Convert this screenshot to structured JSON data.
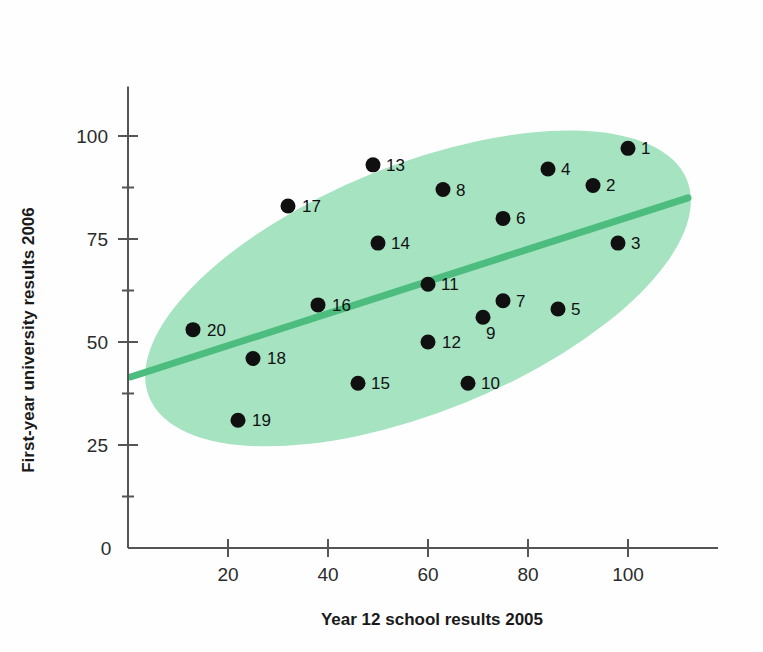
{
  "chart_data": {
    "type": "scatter",
    "title": "",
    "xlabel": "Year 12 school results 2005",
    "ylabel": "First-year university results 2006",
    "xlim": [
      0,
      118
    ],
    "ylim": [
      0,
      112
    ],
    "xticks": [
      0,
      20,
      40,
      60,
      80,
      100
    ],
    "xtick_labels": [
      "0",
      "20",
      "40",
      "60",
      "80",
      "100"
    ],
    "yticks": [
      0,
      25,
      50,
      75,
      100
    ],
    "ytick_labels": [
      "0",
      "25",
      "50",
      "75",
      "100"
    ],
    "grid": false,
    "legend": "none",
    "points": [
      {
        "label": "1",
        "x": 100,
        "y": 97
      },
      {
        "label": "2",
        "x": 93,
        "y": 88
      },
      {
        "label": "3",
        "x": 98,
        "y": 74
      },
      {
        "label": "4",
        "x": 84,
        "y": 92
      },
      {
        "label": "5",
        "x": 86,
        "y": 58
      },
      {
        "label": "6",
        "x": 75,
        "y": 80
      },
      {
        "label": "7",
        "x": 75,
        "y": 60
      },
      {
        "label": "8",
        "x": 63,
        "y": 87
      },
      {
        "label": "9",
        "x": 71,
        "y": 56
      },
      {
        "label": "10",
        "x": 68,
        "y": 40
      },
      {
        "label": "11",
        "x": 60,
        "y": 64
      },
      {
        "label": "12",
        "x": 60,
        "y": 50
      },
      {
        "label": "13",
        "x": 49,
        "y": 93
      },
      {
        "label": "14",
        "x": 50,
        "y": 74
      },
      {
        "label": "15",
        "x": 46,
        "y": 40
      },
      {
        "label": "16",
        "x": 38,
        "y": 59
      },
      {
        "label": "17",
        "x": 32,
        "y": 83
      },
      {
        "label": "18",
        "x": 25,
        "y": 46
      },
      {
        "label": "19",
        "x": 22,
        "y": 31
      },
      {
        "label": "20",
        "x": 13,
        "y": 53
      }
    ],
    "trend_line": {
      "x_start": 0.5,
      "y_start": 41.5,
      "x_end": 112,
      "y_end": 85
    },
    "ellipse_overlay": {
      "center_x": 58,
      "center_y": 63,
      "radius_x": 58,
      "radius_y": 30,
      "rotation_deg": -22
    }
  },
  "colors": {
    "ellipse_fill": "#a5e3c1",
    "trend_line": "#4cbd7e",
    "point_fill": "#101010",
    "axis": "#555555",
    "text": "#1a1a1a",
    "background": "#ffffff"
  }
}
